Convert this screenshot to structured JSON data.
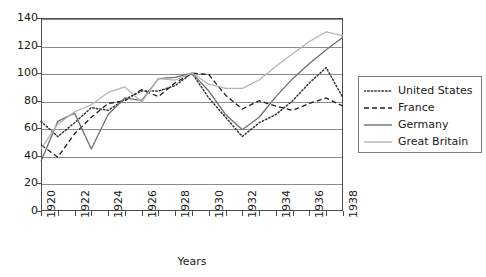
{
  "chart_data": {
    "type": "line",
    "title": "",
    "xlabel": "Years",
    "ylabel": "",
    "xlim": [
      1920,
      1938
    ],
    "ylim": [
      0,
      140
    ],
    "ytick_step": 20,
    "grid": true,
    "legend_position": "right",
    "x": [
      1920,
      1921,
      1922,
      1923,
      1924,
      1925,
      1926,
      1927,
      1928,
      1929,
      1930,
      1931,
      1932,
      1933,
      1934,
      1935,
      1936,
      1937,
      1938
    ],
    "xtick_labels": [
      "1920",
      "1922",
      "1924",
      "1926",
      "1928",
      "1930",
      "1932",
      "1934",
      "1936",
      "1938"
    ],
    "ytick_labels": [
      "0",
      "20",
      "40",
      "60",
      "80",
      "100",
      "120",
      "140"
    ],
    "series": [
      {
        "name": "United States",
        "style": "dotted",
        "color": "#333333",
        "values": [
          65,
          54,
          64,
          75,
          73,
          81,
          87,
          87,
          91,
          100,
          82,
          68,
          54,
          64,
          70,
          80,
          93,
          104,
          82
        ]
      },
      {
        "name": "France",
        "style": "dashed",
        "color": "#1f1f1f",
        "values": [
          48,
          39,
          56,
          68,
          78,
          80,
          88,
          83,
          93,
          100,
          99,
          84,
          74,
          80,
          76,
          73,
          78,
          82,
          76
        ]
      },
      {
        "name": "Germany",
        "style": "solid",
        "color": "#6e6e6e",
        "values": [
          36,
          65,
          71,
          45,
          70,
          82,
          80,
          96,
          97,
          100,
          87,
          70,
          59,
          68,
          83,
          96,
          107,
          117,
          126
        ]
      },
      {
        "name": "Great Britain",
        "style": "solid",
        "color": "#b5b5b5",
        "values": [
          45,
          63,
          72,
          77,
          86,
          90,
          79,
          96,
          95,
          100,
          92,
          89,
          89,
          95,
          105,
          114,
          123,
          130,
          127
        ]
      }
    ]
  },
  "legend": {
    "entries": [
      {
        "label": "United States"
      },
      {
        "label": "France"
      },
      {
        "label": "Germany"
      },
      {
        "label": "Great Britain"
      }
    ]
  },
  "axes": {
    "x_title": "Years"
  }
}
